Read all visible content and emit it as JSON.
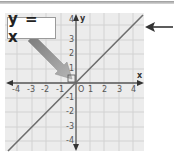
{
  "diagram": {
    "title_label": "y = x",
    "equation": "y = x",
    "x_axis_label": "x",
    "y_axis_label": "y",
    "origin_label": "O",
    "x_ticks": [
      "-4",
      "-3",
      "-2",
      "-1",
      "1",
      "2",
      "3",
      "4"
    ],
    "y_ticks": [
      "4",
      "3",
      "2",
      "1",
      "-1",
      "-2",
      "-3",
      "-4"
    ],
    "x_range": [
      -4,
      4
    ],
    "y_range": [
      -4,
      4
    ],
    "line": {
      "slope": 1,
      "intercept": 0,
      "color": "#6e6e6e"
    },
    "colors": {
      "grid_background": "#ececec",
      "grid_lines": "#cfcfcf",
      "axes": "#555555",
      "pointer_arrow": "#8c8c8c",
      "callout_arrow": "#333333"
    },
    "annotations": [
      {
        "type": "callout-arrow",
        "points_to": "line",
        "side": "right"
      },
      {
        "type": "pointer-arrow",
        "from": "label",
        "to": "origin"
      }
    ]
  }
}
